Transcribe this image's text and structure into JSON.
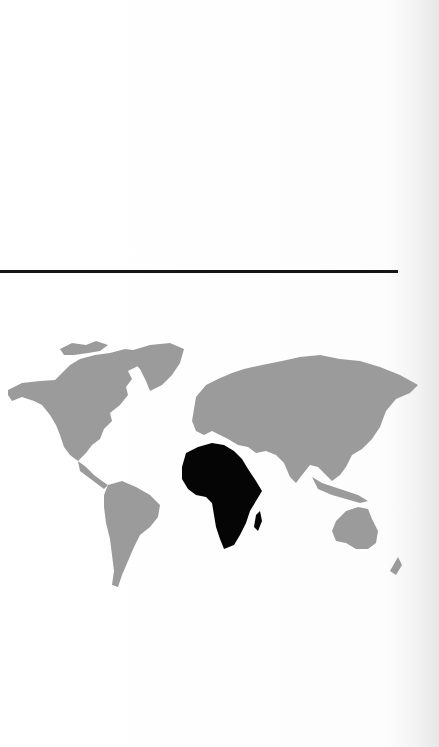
{
  "page": {
    "type": "scanned book page",
    "background_color": "#fdfdfd"
  },
  "divider": {
    "color": "#151515"
  },
  "map": {
    "title": "",
    "projection": "world outline",
    "land_color": "#9b9b9b",
    "highlight_color": "#050505",
    "highlighted_region": "Africa",
    "regions": [
      {
        "name": "North America",
        "highlighted": false
      },
      {
        "name": "Greenland",
        "highlighted": false
      },
      {
        "name": "South America",
        "highlighted": false
      },
      {
        "name": "Europe",
        "highlighted": false
      },
      {
        "name": "Asia",
        "highlighted": false
      },
      {
        "name": "Africa",
        "highlighted": true
      },
      {
        "name": "Madagascar",
        "highlighted": true
      },
      {
        "name": "Australia",
        "highlighted": false
      },
      {
        "name": "New Zealand",
        "highlighted": false
      }
    ]
  }
}
